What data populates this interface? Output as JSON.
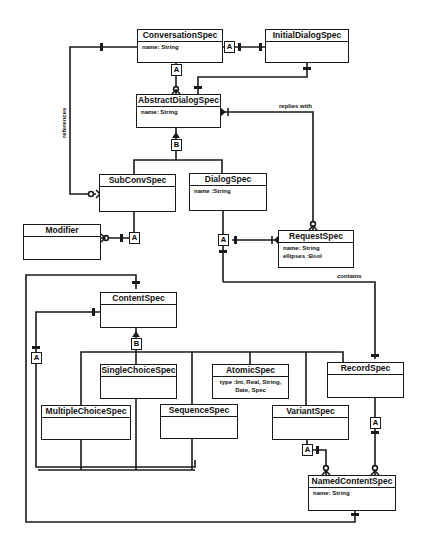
{
  "diagram": {
    "type": "entity-relationship / class diagram",
    "classes": [
      {
        "id": "conversation",
        "name": "ConversationSpec",
        "attrs": "name: String"
      },
      {
        "id": "initial",
        "name": "InitialDialogSpec",
        "attrs": ""
      },
      {
        "id": "abstract",
        "name": "AbstractDialogSpec",
        "attrs": "name: String"
      },
      {
        "id": "subconv",
        "name": "SubConvSpec",
        "attrs": ""
      },
      {
        "id": "dialog",
        "name": "DialogSpec",
        "attrs": "name :String"
      },
      {
        "id": "modifier",
        "name": "Modifier",
        "attrs": ""
      },
      {
        "id": "request",
        "name": "RequestSpec",
        "attrs": "name: String\nellipses :Bool"
      },
      {
        "id": "content",
        "name": "ContentSpec",
        "attrs": ""
      },
      {
        "id": "single",
        "name": "SingleChoiceSpec",
        "attrs": ""
      },
      {
        "id": "atomic",
        "name": "AtomicSpec",
        "attrs": "type :Int, Real, String,\nDate, Spec"
      },
      {
        "id": "record",
        "name": "RecordSpec",
        "attrs": ""
      },
      {
        "id": "multiple",
        "name": "MultipleChoiceSpec",
        "attrs": ""
      },
      {
        "id": "sequence",
        "name": "SequenceSpec",
        "attrs": ""
      },
      {
        "id": "variant",
        "name": "VariantSpec",
        "attrs": ""
      },
      {
        "id": "named",
        "name": "NamedContentSpec",
        "attrs": "name: String"
      }
    ],
    "relationship_labels": {
      "references": "references",
      "replies_with": "replies with",
      "contains": "contains"
    },
    "tags": {
      "aggregation": "A",
      "inheritance": "B"
    }
  }
}
